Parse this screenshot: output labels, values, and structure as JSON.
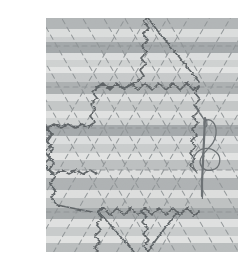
{
  "figure": {
    "label": "5",
    "caption": "",
    "background_color": "#ffffff"
  },
  "fabric": {
    "name": "striped-fabric-panel",
    "left": 46,
    "right": 238,
    "top": 18,
    "bottom": 252,
    "stripe_direction": "horizontal",
    "base_color": "#f2f2f0",
    "stripes": [
      {
        "y": 18,
        "h": 11,
        "color": "#b9bcbd"
      },
      {
        "y": 29,
        "h": 8,
        "color": "#ebeceb"
      },
      {
        "y": 37,
        "h": 5,
        "color": "#d7d9d9"
      },
      {
        "y": 42,
        "h": 11,
        "color": "#a8acae"
      },
      {
        "y": 53,
        "h": 7,
        "color": "#eceded"
      },
      {
        "y": 60,
        "h": 7,
        "color": "#dcdedd"
      },
      {
        "y": 67,
        "h": 6,
        "color": "#f4f4f3"
      },
      {
        "y": 73,
        "h": 9,
        "color": "#d2d4d4"
      },
      {
        "y": 82,
        "h": 12,
        "color": "#b3b6b7"
      },
      {
        "y": 94,
        "h": 7,
        "color": "#eeefee"
      },
      {
        "y": 101,
        "h": 10,
        "color": "#cfd1d1"
      },
      {
        "y": 111,
        "h": 7,
        "color": "#f1f1f0"
      },
      {
        "y": 118,
        "h": 7,
        "color": "#dddfde"
      },
      {
        "y": 125,
        "h": 11,
        "color": "#a9adaf"
      },
      {
        "y": 136,
        "h": 8,
        "color": "#eceded"
      },
      {
        "y": 144,
        "h": 9,
        "color": "#d5d7d7"
      },
      {
        "y": 153,
        "h": 7,
        "color": "#f3f3f2"
      },
      {
        "y": 160,
        "h": 10,
        "color": "#c6c9c9"
      },
      {
        "y": 170,
        "h": 8,
        "color": "#efefee"
      },
      {
        "y": 178,
        "h": 12,
        "color": "#b5b8b9"
      },
      {
        "y": 190,
        "h": 8,
        "color": "#ededec"
      },
      {
        "y": 198,
        "h": 10,
        "color": "#c9cbcb"
      },
      {
        "y": 208,
        "h": 11,
        "color": "#a9adae"
      },
      {
        "y": 219,
        "h": 8,
        "color": "#f0f0ef"
      },
      {
        "y": 227,
        "h": 9,
        "color": "#d4d6d6"
      },
      {
        "y": 236,
        "h": 7,
        "color": "#f2f2f1"
      },
      {
        "y": 243,
        "h": 9,
        "color": "#c2c5c5"
      }
    ]
  },
  "markings": {
    "name": "chalk-marked-triangular-grid",
    "style": "dashed",
    "color": "#8f9496",
    "horizontal_lines_y": [
      46,
      87,
      128,
      170,
      212
    ],
    "diagonal_spacing_x": 41,
    "diagonal_angle_deg": 60,
    "description": "dashed equilateral-triangle grid drawn across the stripes"
  },
  "stitching": {
    "name": "wavy-gathering-thread",
    "color": "#5b6164",
    "style": "crinkled-wavy-line",
    "path_description": "large hexagonal outline following the marked grid",
    "segments": [
      {
        "from": [
          148,
          18
        ],
        "to": [
          97,
          87
        ]
      },
      {
        "from": [
          97,
          87
        ],
        "to": [
          199,
          87
        ]
      },
      {
        "from": [
          97,
          87
        ],
        "to": [
          46,
          128
        ]
      },
      {
        "from": [
          199,
          87
        ],
        "to": [
          199,
          170
        ]
      },
      {
        "from": [
          46,
          128
        ],
        "to": [
          97,
          212
        ]
      },
      {
        "from": [
          97,
          212
        ],
        "to": [
          199,
          212
        ]
      },
      {
        "from": [
          97,
          212
        ],
        "to": [
          148,
          252
        ]
      }
    ]
  },
  "needle": {
    "name": "threaded-sewing-needle",
    "color": "#6d7275",
    "tip_x": 202,
    "tip_y": 196,
    "eye_x": 206,
    "eye_y": 120,
    "thread_loop": "long looping thread trailing from the needle eye down to the fabric"
  }
}
